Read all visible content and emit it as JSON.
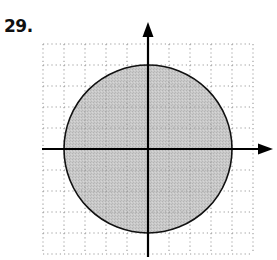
{
  "problem": {
    "number_label": "29."
  },
  "figure": {
    "type": "coordinate-plane-with-shaded-circle",
    "grid": {
      "units_left": 5,
      "units_right": 5,
      "units_up": 5,
      "units_down": 5,
      "line_style": "dotted",
      "line_color": "#9a9a9a"
    },
    "axes": {
      "x_arrow": "right",
      "y_arrow": "up",
      "color": "#000000"
    },
    "circle": {
      "center": [
        0,
        0
      ],
      "radius": 4,
      "fill_color": "#c6c6c6",
      "stroke_color": "#111111",
      "boundary": "solid",
      "shaded_region": "inside"
    }
  }
}
